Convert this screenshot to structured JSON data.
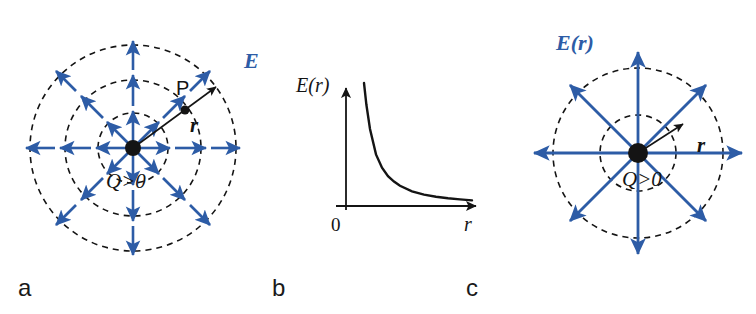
{
  "figure": {
    "colors": {
      "field_blue": "#2d5ca6",
      "line_black": "#141414",
      "background": "#ffffff"
    },
    "panel_labels": {
      "a": "a",
      "b": "b",
      "c": "c"
    }
  },
  "panel_a": {
    "label": "a",
    "charge_label": "Q>0",
    "point_label": "P",
    "radius_label": "r",
    "field_label": "E",
    "description": "Radial electric field lines from a positive point charge with three dashed equipotential circles",
    "center": {
      "x": 133,
      "y": 148
    },
    "circle_radii": [
      35,
      68,
      103
    ],
    "arrow_directions_deg": [
      0,
      45,
      90,
      135,
      180,
      225,
      270,
      315
    ],
    "point_p": {
      "x": 185,
      "y": 100
    },
    "radius_arrow_end": {
      "x": 219,
      "y": 85
    }
  },
  "panel_b": {
    "label": "b",
    "ylabel": "E(r)",
    "xlabel": "r",
    "origin_label": "0",
    "chart_data": {
      "type": "line",
      "title": "",
      "xlabel": "r",
      "ylabel": "E(r)",
      "grid": false,
      "legend": null,
      "relationship": "E(r) proportional to 1/r^2",
      "xlim": [
        0,
        10
      ],
      "ylim": [
        0,
        10
      ],
      "x": [
        1.0,
        1.2,
        1.5,
        2.0,
        2.5,
        3.0,
        3.5,
        4.0,
        5.0,
        6.0,
        7.0,
        8.0,
        9.0,
        10.0
      ],
      "y": [
        10.0,
        8.2,
        6.2,
        4.1,
        3.0,
        2.3,
        1.85,
        1.5,
        1.05,
        0.78,
        0.6,
        0.47,
        0.38,
        0.3
      ]
    }
  },
  "panel_c": {
    "label": "c",
    "charge_label": "Q>0",
    "radius_label": "r",
    "field_label": "E(r)",
    "description": "Radial electric field lines from a positive point charge with an inner and an outer dashed Gaussian circle",
    "center": {
      "x": 638,
      "y": 153
    },
    "circle_radii": [
      38,
      85
    ],
    "arrow_directions_deg": [
      0,
      45,
      90,
      135,
      180,
      225,
      270,
      315
    ],
    "radius_arrow_end": {
      "x": 686,
      "y": 122
    }
  }
}
